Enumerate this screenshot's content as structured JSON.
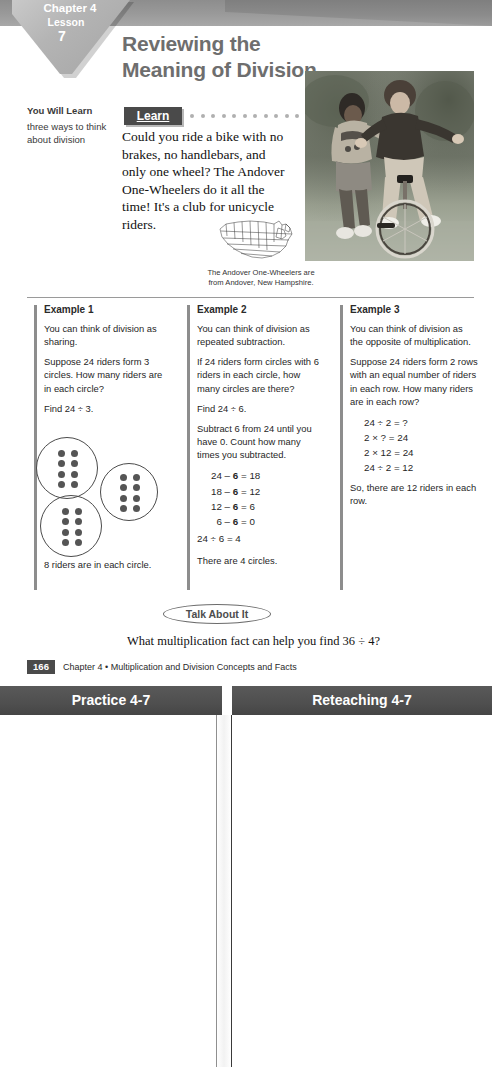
{
  "header": {
    "chapter": "Chapter 4",
    "lesson_label": "Lesson",
    "lesson_number": "7",
    "title": "Reviewing the Meaning of Division"
  },
  "you_will_learn": {
    "heading": "You Will Learn",
    "body": "three ways to think about division"
  },
  "learn": {
    "label": "Learn",
    "paragraph": "Could you ride a bike with no brakes, no handlebars, and only one wheel? The Andover One-Wheelers do it all the time! It's a club for unicycle riders.",
    "dot_count": 11
  },
  "figure": {
    "caption": "The Andover One-Wheelers are from Andover, New Hampshire.",
    "photo_alt": "two children outdoors, one riding a unicycle",
    "map_alt": "outline map of the United States"
  },
  "examples": [
    {
      "heading": "Example 1",
      "paragraphs": [
        "You can think of division as sharing.",
        "Suppose 24 riders form 3 circles. How many riders are in each circle?",
        "Find 24 ÷ 3."
      ],
      "diagram": {
        "circles": 3,
        "dots_per_circle": 8,
        "rows_per_circle": 4,
        "cols_per_circle": 2
      },
      "conclusion": "8 riders are in each circle."
    },
    {
      "heading": "Example 2",
      "paragraphs": [
        "You can think of division as repeated subtraction.",
        "If 24 riders form circles with 6 riders in each circle, how many circles are there?",
        "Find 24 ÷ 6.",
        "Subtract 6 from 24 until you have 0. Count how many times you subtracted."
      ],
      "steps": [
        "24 – 6 = 18",
        "18 – 6 = 12",
        "12 – 6 = 6",
        "  6 – 6 = 0"
      ],
      "result": "24 ÷ 6 = 4",
      "conclusion": "There are 4 circles."
    },
    {
      "heading": "Example 3",
      "paragraphs": [
        "You can think of division as the opposite of multiplication.",
        "Suppose 24 riders form 2 rows with an equal number of riders in each row. How many riders are in each row?"
      ],
      "steps": [
        "24 ÷ 2 = ?",
        "2 × ? = 24",
        "2 × 12 = 24",
        "24 ÷ 2 = 12"
      ],
      "conclusion": "So, there are 12 riders in each row."
    }
  ],
  "talk_about_it": {
    "label": "Talk About It",
    "question": "What multiplication fact can help you find 36 ÷ 4?"
  },
  "footer": {
    "page_number": "166",
    "text": "Chapter 4 • Multiplication and Division Concepts and Facts"
  },
  "worksheets": {
    "left_title": "Practice 4-7",
    "right_title": "Reteaching 4-7"
  },
  "colors": {
    "band_gray": "#9a9a9a",
    "tab_gray": "#b4b4b4",
    "title_gray": "#6e6e6e",
    "dark_box": "#4a4a4a",
    "worksheet_header": "#4f4f4f"
  }
}
